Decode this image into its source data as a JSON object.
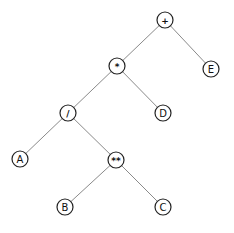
{
  "diagram": {
    "type": "expression-tree",
    "expression": "(A / B ** C) * D + E",
    "nodes": [
      {
        "id": "plus",
        "label": "+",
        "kind": "operator",
        "x": 165,
        "y": 20
      },
      {
        "id": "times",
        "label": "*",
        "kind": "operator",
        "x": 117,
        "y": 66
      },
      {
        "id": "E",
        "label": "E",
        "kind": "operand",
        "x": 211,
        "y": 69
      },
      {
        "id": "div",
        "label": "/",
        "kind": "operator",
        "x": 68,
        "y": 113
      },
      {
        "id": "D",
        "label": "D",
        "kind": "operand",
        "x": 163,
        "y": 113
      },
      {
        "id": "A",
        "label": "A",
        "kind": "operand",
        "x": 20,
        "y": 159
      },
      {
        "id": "pow",
        "label": "**",
        "kind": "operator",
        "x": 116,
        "y": 160
      },
      {
        "id": "B",
        "label": "B",
        "kind": "operand",
        "x": 65,
        "y": 207
      },
      {
        "id": "C",
        "label": "C",
        "kind": "operand",
        "x": 163,
        "y": 207
      }
    ],
    "edges": [
      {
        "from": "plus",
        "to": "times"
      },
      {
        "from": "plus",
        "to": "E"
      },
      {
        "from": "times",
        "to": "div"
      },
      {
        "from": "times",
        "to": "D"
      },
      {
        "from": "div",
        "to": "A"
      },
      {
        "from": "div",
        "to": "pow"
      },
      {
        "from": "pow",
        "to": "B"
      },
      {
        "from": "pow",
        "to": "C"
      }
    ],
    "node_radius": 8,
    "colors": {
      "edge": "#8a8a8a",
      "node_stroke": "#222222",
      "node_fill": "#ffffff",
      "text": "#111111",
      "background": "#ffffff"
    }
  }
}
